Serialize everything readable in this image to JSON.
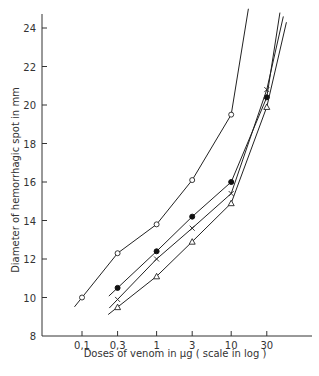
{
  "chart_data": {
    "type": "line",
    "title": "",
    "xlabel": "Doses of venom in μg ( scale in log )",
    "ylabel": "Diameter of hemorrhagic spot in mm",
    "xscale": "log",
    "xticks": [
      "0,1",
      "0,3",
      "1",
      "3",
      "10",
      "30"
    ],
    "xtick_values": [
      0.1,
      0.3,
      1,
      3,
      10,
      30
    ],
    "yticks": [
      8,
      10,
      12,
      14,
      16,
      18,
      20,
      22,
      24
    ],
    "ylim": [
      8,
      25
    ],
    "grid": false,
    "legend": null,
    "series": [
      {
        "name": "open-circle",
        "marker": "circle-open",
        "x": [
          0.1,
          0.3,
          1,
          3,
          10
        ],
        "y": [
          10.0,
          12.3,
          13.8,
          16.1,
          19.5
        ],
        "line_extends_to": {
          "x": 17,
          "y": 25
        }
      },
      {
        "name": "filled-circle",
        "marker": "circle-filled",
        "x": [
          0.3,
          1,
          3,
          10,
          30
        ],
        "y": [
          10.5,
          12.4,
          14.2,
          16.0,
          20.4
        ],
        "line_extends_to": {
          "x": 45,
          "y": 24.8
        }
      },
      {
        "name": "cross",
        "marker": "cross",
        "x": [
          0.3,
          1,
          3,
          10,
          30
        ],
        "y": [
          9.9,
          12.0,
          13.6,
          15.4,
          20.8
        ],
        "line_extends_to": {
          "x": 50,
          "y": 24.6
        }
      },
      {
        "name": "triangle",
        "marker": "triangle-open",
        "x": [
          0.3,
          1,
          3,
          10,
          30
        ],
        "y": [
          9.5,
          11.1,
          12.9,
          14.9,
          19.9
        ],
        "line_extends_to": {
          "x": 55,
          "y": 24.3
        }
      }
    ]
  },
  "axes": {
    "x_title": "Doses of venom in μg ( scale in log )",
    "y_title": "Diameter of hemorrhagic spot in mm"
  }
}
